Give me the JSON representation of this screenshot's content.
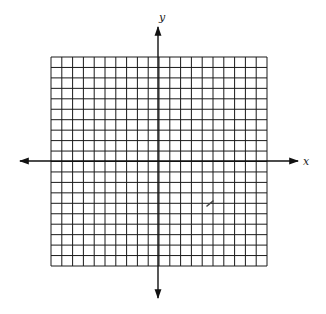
{
  "figure": {
    "grid": {
      "columns": 20,
      "rows": 20,
      "left": 51,
      "top": 57,
      "right": 267,
      "bottom": 266,
      "line_color": "#1a1a1a",
      "line_width": 1
    },
    "axes": {
      "origin": {
        "x": 158,
        "y": 161
      },
      "x_axis": {
        "label": "x",
        "from": 20,
        "to": 298
      },
      "y_axis": {
        "label": "y",
        "from": 27,
        "to": 298
      },
      "color": "#111111",
      "line_width": 1.4
    },
    "stray_mark": {
      "x": 210,
      "y": 204
    },
    "background": "#ffffff"
  }
}
